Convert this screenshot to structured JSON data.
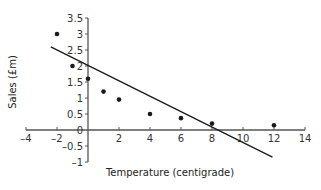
{
  "chart_data": {
    "type": "scatter",
    "title": "",
    "xlabel": "Temperature (centigrade)",
    "ylabel": "Sales (£m)",
    "xlim": [
      -4,
      14
    ],
    "ylim": [
      -1,
      3.5
    ],
    "grid": false,
    "legend": null,
    "x_ticks": [
      -4,
      -2,
      2,
      4,
      6,
      8,
      10,
      12,
      14
    ],
    "x_tick_labels": [
      "–4",
      "–2",
      "2",
      "4",
      "6",
      "8",
      "10",
      "12",
      "14"
    ],
    "y_ticks": [
      3.5,
      3,
      2.5,
      2,
      1.5,
      1,
      0.5,
      0,
      -0.5,
      -1
    ],
    "y_tick_labels": [
      "3.5",
      "3",
      "2.5",
      "2",
      "1.5",
      "1",
      "0.5",
      "0",
      "–0.5",
      "–1"
    ],
    "series": [
      {
        "name": "Sales data",
        "type": "scatter",
        "x": [
          -2,
          -1,
          0,
          1,
          2,
          4,
          6,
          8,
          12
        ],
        "y": [
          3.0,
          2.0,
          1.6,
          1.2,
          0.95,
          0.5,
          0.37,
          0.2,
          0.15
        ]
      },
      {
        "name": "Line of best fit",
        "type": "line",
        "x": [
          -2.4,
          11.9
        ],
        "y": [
          2.6,
          -0.85
        ]
      }
    ]
  },
  "colors": {
    "axis": "#555555",
    "points": "#1a1a1a",
    "line": "#1a1a1a",
    "text": "#333333"
  }
}
